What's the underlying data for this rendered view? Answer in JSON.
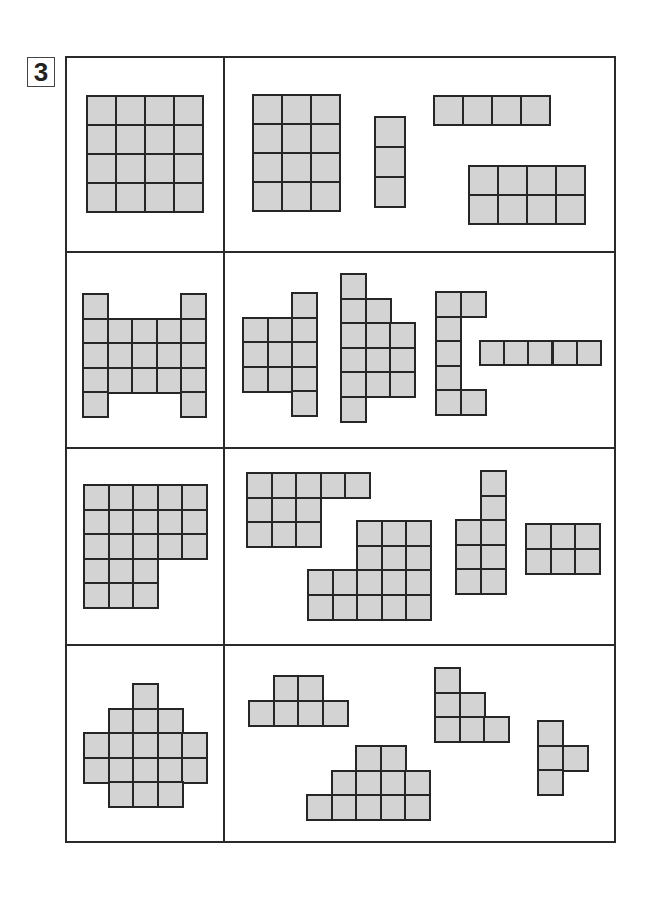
{
  "puzzle_number": "3",
  "colors": {
    "cell_fill": "#d3d3d3",
    "cell_border": "#262626",
    "frame": "#2a2a2a"
  },
  "rows": [
    {
      "target": {
        "name": "square-4x4",
        "x": 86,
        "y": 95,
        "cell": 29,
        "cells": [
          [
            0,
            0
          ],
          [
            1,
            0
          ],
          [
            2,
            0
          ],
          [
            3,
            0
          ],
          [
            0,
            1
          ],
          [
            1,
            1
          ],
          [
            2,
            1
          ],
          [
            3,
            1
          ],
          [
            0,
            2
          ],
          [
            1,
            2
          ],
          [
            2,
            2
          ],
          [
            3,
            2
          ],
          [
            0,
            3
          ],
          [
            1,
            3
          ],
          [
            2,
            3
          ],
          [
            3,
            3
          ]
        ]
      },
      "pieces": [
        {
          "name": "rect-3x4",
          "x": 252,
          "y": 94,
          "cell": 29,
          "cells": [
            [
              0,
              0
            ],
            [
              1,
              0
            ],
            [
              2,
              0
            ],
            [
              0,
              1
            ],
            [
              1,
              1
            ],
            [
              2,
              1
            ],
            [
              0,
              2
            ],
            [
              1,
              2
            ],
            [
              2,
              2
            ],
            [
              0,
              3
            ],
            [
              1,
              3
            ],
            [
              2,
              3
            ]
          ]
        },
        {
          "name": "bar-1x3",
          "x": 374,
          "y": 116,
          "cell": 30,
          "cells": [
            [
              0,
              0
            ],
            [
              0,
              1
            ],
            [
              0,
              2
            ]
          ]
        },
        {
          "name": "bar-4x1",
          "x": 433,
          "y": 95,
          "cell": 29,
          "cells": [
            [
              0,
              0
            ],
            [
              1,
              0
            ],
            [
              2,
              0
            ],
            [
              3,
              0
            ]
          ]
        },
        {
          "name": "rect-4x2",
          "x": 468,
          "y": 165,
          "cell": 29,
          "cells": [
            [
              0,
              0
            ],
            [
              1,
              0
            ],
            [
              2,
              0
            ],
            [
              3,
              0
            ],
            [
              0,
              1
            ],
            [
              1,
              1
            ],
            [
              2,
              1
            ],
            [
              3,
              1
            ]
          ]
        }
      ]
    },
    {
      "target": {
        "name": "h-shape",
        "x": 82,
        "y": 293,
        "cell": 24.6,
        "cells": [
          [
            0,
            0
          ],
          [
            4,
            0
          ],
          [
            0,
            1
          ],
          [
            1,
            1
          ],
          [
            2,
            1
          ],
          [
            3,
            1
          ],
          [
            4,
            1
          ],
          [
            0,
            2
          ],
          [
            1,
            2
          ],
          [
            2,
            2
          ],
          [
            3,
            2
          ],
          [
            4,
            2
          ],
          [
            0,
            3
          ],
          [
            1,
            3
          ],
          [
            2,
            3
          ],
          [
            3,
            3
          ],
          [
            4,
            3
          ],
          [
            0,
            4
          ],
          [
            4,
            4
          ]
        ]
      },
      "pieces": [
        {
          "name": "piece-a",
          "x": 242,
          "y": 292,
          "cell": 24.6,
          "cells": [
            [
              2,
              0
            ],
            [
              0,
              1
            ],
            [
              1,
              1
            ],
            [
              2,
              1
            ],
            [
              0,
              2
            ],
            [
              1,
              2
            ],
            [
              2,
              2
            ],
            [
              0,
              3
            ],
            [
              1,
              3
            ],
            [
              2,
              3
            ],
            [
              2,
              4
            ]
          ]
        },
        {
          "name": "piece-b",
          "x": 340,
          "y": 273,
          "cell": 24.6,
          "cells": [
            [
              0,
              0
            ],
            [
              0,
              1
            ],
            [
              1,
              1
            ],
            [
              0,
              2
            ],
            [
              1,
              2
            ],
            [
              2,
              2
            ],
            [
              0,
              3
            ],
            [
              1,
              3
            ],
            [
              2,
              3
            ],
            [
              0,
              4
            ],
            [
              1,
              4
            ],
            [
              2,
              4
            ],
            [
              0,
              5
            ]
          ]
        },
        {
          "name": "piece-c",
          "x": 435,
          "y": 291,
          "cell": 24.6,
          "cells": [
            [
              0,
              0
            ],
            [
              1,
              0
            ],
            [
              0,
              1
            ],
            [
              0,
              2
            ],
            [
              0,
              3
            ],
            [
              0,
              4
            ],
            [
              1,
              4
            ]
          ]
        },
        {
          "name": "bar-5x1",
          "x": 479,
          "y": 340,
          "cell": 24.2,
          "cells": [
            [
              0,
              0
            ],
            [
              1,
              0
            ],
            [
              2,
              0
            ],
            [
              3,
              0
            ],
            [
              4,
              0
            ]
          ]
        }
      ]
    },
    {
      "target": {
        "name": "l-block",
        "x": 83,
        "y": 484,
        "cell": 24.6,
        "cells": [
          [
            0,
            0
          ],
          [
            1,
            0
          ],
          [
            2,
            0
          ],
          [
            3,
            0
          ],
          [
            4,
            0
          ],
          [
            0,
            1
          ],
          [
            1,
            1
          ],
          [
            2,
            1
          ],
          [
            3,
            1
          ],
          [
            4,
            1
          ],
          [
            0,
            2
          ],
          [
            1,
            2
          ],
          [
            2,
            2
          ],
          [
            3,
            2
          ],
          [
            4,
            2
          ],
          [
            0,
            3
          ],
          [
            1,
            3
          ],
          [
            2,
            3
          ],
          [
            0,
            4
          ],
          [
            1,
            4
          ],
          [
            2,
            4
          ]
        ]
      },
      "pieces": [
        {
          "name": "piece-e",
          "x": 246,
          "y": 472,
          "cell": 24.6,
          "cells": [
            [
              0,
              0
            ],
            [
              1,
              0
            ],
            [
              2,
              0
            ],
            [
              3,
              0
            ],
            [
              4,
              0
            ],
            [
              0,
              1
            ],
            [
              1,
              1
            ],
            [
              2,
              1
            ],
            [
              0,
              2
            ],
            [
              1,
              2
            ],
            [
              2,
              2
            ]
          ]
        },
        {
          "name": "piece-f",
          "x": 307,
          "y": 520,
          "cell": 24.6,
          "cells": [
            [
              2,
              0
            ],
            [
              3,
              0
            ],
            [
              4,
              0
            ],
            [
              2,
              1
            ],
            [
              3,
              1
            ],
            [
              4,
              1
            ],
            [
              0,
              2
            ],
            [
              1,
              2
            ],
            [
              2,
              2
            ],
            [
              3,
              2
            ],
            [
              4,
              2
            ],
            [
              0,
              3
            ],
            [
              1,
              3
            ],
            [
              2,
              3
            ],
            [
              3,
              3
            ],
            [
              4,
              3
            ]
          ]
        },
        {
          "name": "piece-g",
          "x": 455,
          "y": 470,
          "cell": 24.6,
          "cells": [
            [
              1,
              0
            ],
            [
              1,
              1
            ],
            [
              0,
              2
            ],
            [
              1,
              2
            ],
            [
              0,
              3
            ],
            [
              1,
              3
            ],
            [
              0,
              4
            ],
            [
              1,
              4
            ]
          ]
        },
        {
          "name": "rect-3x2",
          "x": 525,
          "y": 523,
          "cell": 24.6,
          "cells": [
            [
              0,
              0
            ],
            [
              1,
              0
            ],
            [
              2,
              0
            ],
            [
              0,
              1
            ],
            [
              1,
              1
            ],
            [
              2,
              1
            ]
          ]
        }
      ]
    },
    {
      "target": {
        "name": "diamond",
        "x": 83,
        "y": 683,
        "cell": 24.6,
        "cells": [
          [
            2,
            0
          ],
          [
            1,
            1
          ],
          [
            2,
            1
          ],
          [
            3,
            1
          ],
          [
            0,
            2
          ],
          [
            1,
            2
          ],
          [
            2,
            2
          ],
          [
            3,
            2
          ],
          [
            4,
            2
          ],
          [
            0,
            3
          ],
          [
            1,
            3
          ],
          [
            2,
            3
          ],
          [
            3,
            3
          ],
          [
            4,
            3
          ],
          [
            1,
            4
          ],
          [
            2,
            4
          ],
          [
            3,
            4
          ]
        ]
      },
      "pieces": [
        {
          "name": "piece-i",
          "x": 248,
          "y": 675,
          "cell": 24.6,
          "cells": [
            [
              1,
              0
            ],
            [
              2,
              0
            ],
            [
              0,
              1
            ],
            [
              1,
              1
            ],
            [
              2,
              1
            ],
            [
              3,
              1
            ]
          ]
        },
        {
          "name": "piece-j",
          "x": 306,
          "y": 745,
          "cell": 24.6,
          "cells": [
            [
              2,
              0
            ],
            [
              3,
              0
            ],
            [
              1,
              1
            ],
            [
              2,
              1
            ],
            [
              3,
              1
            ],
            [
              4,
              1
            ],
            [
              0,
              2
            ],
            [
              1,
              2
            ],
            [
              2,
              2
            ],
            [
              3,
              2
            ],
            [
              4,
              2
            ]
          ]
        },
        {
          "name": "piece-k",
          "x": 434,
          "y": 667,
          "cell": 24.6,
          "cells": [
            [
              0,
              0
            ],
            [
              0,
              1
            ],
            [
              1,
              1
            ],
            [
              0,
              2
            ],
            [
              1,
              2
            ],
            [
              2,
              2
            ]
          ]
        },
        {
          "name": "piece-l",
          "x": 537,
          "y": 720,
          "cell": 24.6,
          "cells": [
            [
              0,
              0
            ],
            [
              0,
              1
            ],
            [
              1,
              1
            ],
            [
              0,
              2
            ]
          ]
        }
      ]
    }
  ]
}
